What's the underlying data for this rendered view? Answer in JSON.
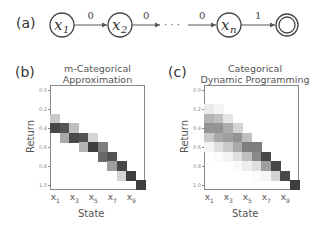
{
  "diagram": {
    "panel_label": "(a)",
    "states": [
      {
        "id": "x1",
        "label": "x",
        "sub": "1",
        "cx": 62
      },
      {
        "id": "x2",
        "label": "x",
        "sub": "2",
        "cx": 120
      },
      {
        "id": "xn",
        "label": "x",
        "sub": "n",
        "cx": 229
      },
      {
        "id": "terminal",
        "label": "",
        "sub": "",
        "cx": 287,
        "terminal": true
      }
    ],
    "transitions": [
      {
        "from": "x1",
        "to": "x2",
        "reward": "0"
      },
      {
        "from": "x2",
        "to": "dots",
        "reward": "0"
      },
      {
        "from": "dots",
        "to": "xn",
        "reward": "0"
      },
      {
        "from": "xn",
        "to": "terminal",
        "reward": "1"
      }
    ],
    "ellipsis": "· · ·"
  },
  "panels": [
    {
      "panel_label": "(b)",
      "title_line1": "m-Categorical",
      "title_line2": "Approximation",
      "ylabel": "Return",
      "xlabel": "State"
    },
    {
      "panel_label": "(c)",
      "title_line1": "Categorical",
      "title_line2": "Dynamic Programming",
      "ylabel": "Return",
      "xlabel": "State"
    }
  ],
  "chart_data": [
    {
      "type": "heatmap",
      "title": "m-Categorical Approximation",
      "xlabel": "State",
      "ylabel": "Return",
      "x_categories": [
        "x1",
        "x2",
        "x3",
        "x4",
        "x5",
        "x6",
        "x7",
        "x8",
        "x9",
        "x10"
      ],
      "x_tick_labels": [
        "x1",
        "x3",
        "x5",
        "x7",
        "x9"
      ],
      "y_categories": [
        0.0,
        0.1,
        0.2,
        0.3,
        0.4,
        0.5,
        0.6,
        0.7,
        0.8,
        0.9,
        1.0
      ],
      "y_tick_labels": [
        "0.0",
        "0.2",
        "0.4",
        "0.6",
        "0.8",
        "1.0"
      ],
      "colormap": "greys",
      "values": [
        [
          0,
          0,
          0,
          0,
          0,
          0,
          0,
          0,
          0,
          0
        ],
        [
          0,
          0,
          0,
          0,
          0,
          0,
          0,
          0,
          0,
          0
        ],
        [
          0,
          0,
          0,
          0,
          0,
          0,
          0,
          0,
          0,
          0
        ],
        [
          0.25,
          0,
          0,
          0,
          0,
          0,
          0,
          0,
          0,
          0
        ],
        [
          0.85,
          0.8,
          0.3,
          0,
          0,
          0,
          0,
          0,
          0,
          0
        ],
        [
          0,
          0.4,
          0.85,
          0.8,
          0.2,
          0,
          0,
          0,
          0,
          0
        ],
        [
          0,
          0,
          0,
          0.35,
          0.9,
          0.6,
          0,
          0,
          0,
          0
        ],
        [
          0,
          0,
          0,
          0,
          0,
          0.7,
          0.8,
          0,
          0,
          0
        ],
        [
          0,
          0,
          0,
          0,
          0,
          0,
          0.45,
          0.85,
          0,
          0
        ],
        [
          0,
          0,
          0,
          0,
          0,
          0,
          0,
          0.2,
          0.9,
          0
        ],
        [
          0,
          0,
          0,
          0,
          0,
          0,
          0,
          0,
          0,
          0.9
        ]
      ]
    },
    {
      "type": "heatmap",
      "title": "Categorical Dynamic Programming",
      "xlabel": "State",
      "ylabel": "Return",
      "x_categories": [
        "x1",
        "x2",
        "x3",
        "x4",
        "x5",
        "x6",
        "x7",
        "x8",
        "x9",
        "x10"
      ],
      "x_tick_labels": [
        "x1",
        "x3",
        "x5",
        "x7",
        "x9"
      ],
      "y_categories": [
        0.0,
        0.1,
        0.2,
        0.3,
        0.4,
        0.5,
        0.6,
        0.7,
        0.8,
        0.9,
        1.0
      ],
      "y_tick_labels": [
        "0.0",
        "0.2",
        "0.4",
        "0.6",
        "0.8",
        "1.0"
      ],
      "colormap": "greys",
      "values": [
        [
          0,
          0,
          0,
          0,
          0,
          0,
          0,
          0,
          0,
          0
        ],
        [
          0,
          0,
          0,
          0,
          0,
          0,
          0,
          0,
          0,
          0
        ],
        [
          0.1,
          0.05,
          0,
          0,
          0,
          0,
          0,
          0,
          0,
          0
        ],
        [
          0.35,
          0.3,
          0.12,
          0,
          0,
          0,
          0,
          0,
          0,
          0
        ],
        [
          0.5,
          0.5,
          0.38,
          0.2,
          0,
          0,
          0,
          0,
          0,
          0
        ],
        [
          0.25,
          0.4,
          0.45,
          0.5,
          0.3,
          0,
          0,
          0,
          0,
          0
        ],
        [
          0.05,
          0.15,
          0.25,
          0.4,
          0.6,
          0.6,
          0,
          0,
          0,
          0
        ],
        [
          0,
          0.02,
          0.05,
          0.15,
          0.3,
          0.55,
          0.85,
          0,
          0,
          0
        ],
        [
          0,
          0,
          0,
          0.03,
          0.08,
          0.15,
          0.45,
          0.85,
          0,
          0
        ],
        [
          0,
          0,
          0,
          0,
          0,
          0.02,
          0.05,
          0.2,
          0.85,
          0
        ],
        [
          0,
          0,
          0,
          0,
          0,
          0,
          0,
          0,
          0,
          0.9
        ]
      ]
    }
  ]
}
